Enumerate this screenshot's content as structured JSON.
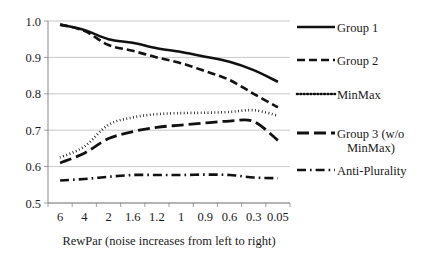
{
  "chart_data": {
    "type": "line",
    "title": "",
    "xlabel": "RewPar (noise increases from left to right)",
    "ylabel": "",
    "categories": [
      "6",
      "4",
      "2",
      "1.6",
      "1.2",
      "1",
      "0.9",
      "0.6",
      "0.3",
      "0.05"
    ],
    "ylim": [
      0.5,
      1.0
    ],
    "ytick_labels": [
      "0.5",
      "0.6",
      "0.7",
      "0.8",
      "0.9",
      "1.0"
    ],
    "ytick_values": [
      0.5,
      0.6,
      0.7,
      0.8,
      0.9,
      1.0
    ],
    "grid": true,
    "legend_position": "right",
    "series": [
      {
        "name": "Group 1",
        "style": "solid",
        "values": [
          0.99,
          0.975,
          0.95,
          0.94,
          0.925,
          0.915,
          0.902,
          0.888,
          0.865,
          0.833
        ]
      },
      {
        "name": "Group 2",
        "style": "dashed",
        "values": [
          0.99,
          0.973,
          0.934,
          0.918,
          0.9,
          0.884,
          0.862,
          0.838,
          0.8,
          0.763
        ]
      },
      {
        "name": "MinMax",
        "style": "dotted",
        "values": [
          0.625,
          0.655,
          0.715,
          0.735,
          0.744,
          0.747,
          0.748,
          0.75,
          0.755,
          0.74
        ]
      },
      {
        "name": "Group 3 (w/o MinMax)",
        "style": "longdash",
        "values": [
          0.61,
          0.637,
          0.677,
          0.696,
          0.708,
          0.714,
          0.72,
          0.725,
          0.724,
          0.672
        ]
      },
      {
        "name": "Anti-Plurality",
        "style": "dashdot",
        "values": [
          0.562,
          0.566,
          0.572,
          0.577,
          0.577,
          0.577,
          0.578,
          0.577,
          0.57,
          0.568
        ]
      }
    ]
  },
  "legend": {
    "items": [
      {
        "label": "Group 1",
        "style": "solid"
      },
      {
        "label": "Group 2",
        "style": "dashed"
      },
      {
        "label": "MinMax",
        "style": "dotted"
      },
      {
        "label": "Group 3 (w/o",
        "label2": "MinMax)",
        "style": "longdash"
      },
      {
        "label": "Anti-Plurality",
        "style": "dashdot"
      }
    ]
  },
  "colors": {
    "line": "#111111",
    "grid": "#b0b0b0",
    "axis": "#7a7a7a",
    "text": "#1a1a1a",
    "background": "#ffffff"
  }
}
